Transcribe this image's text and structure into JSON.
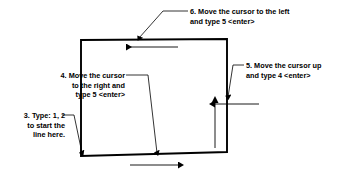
{
  "diagram": {
    "stroke_color": "#000000",
    "background_color": "#ffffff",
    "fill_color": "#ffffff",
    "callouts": [
      {
        "id": "callout-3",
        "number": "3",
        "text": "3. Type: 1, 2\nto start the\nline here.",
        "align": "right",
        "leader_target": "bottom-left-corner"
      },
      {
        "id": "callout-4",
        "number": "4",
        "text": "4. Move the cursor\nto the right and\ntype 5 <enter>",
        "align": "right",
        "leader_target": "bottom-edge"
      },
      {
        "id": "callout-5",
        "number": "5",
        "text": "5. Move the cursor up\nand type 4 <enter>",
        "align": "left",
        "leader_target": "right-edge"
      },
      {
        "id": "callout-6",
        "number": "6",
        "text": "6. Move the cursor to the left\nand type 5 <enter>",
        "align": "left",
        "leader_target": "top-edge"
      }
    ],
    "shape": {
      "name": "quadrilateral-outline",
      "points": "81,40 227,39 227,152 81,156"
    },
    "direction_arrows": [
      {
        "name": "top-arrow-left",
        "direction": "left",
        "x1": 178,
        "y1": 47,
        "x2": 121,
        "y2": 47
      },
      {
        "name": "bottom-arrow-right",
        "direction": "right",
        "x1": 130,
        "y1": 165,
        "x2": 183,
        "y2": 165
      },
      {
        "name": "right-arrow-up",
        "direction": "up",
        "x1": 215,
        "y1": 148,
        "x2": 215,
        "y2": 100
      }
    ]
  }
}
